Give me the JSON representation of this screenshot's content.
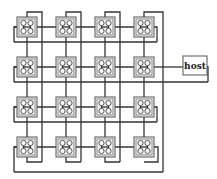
{
  "diagram": {
    "grid": {
      "rows": 4,
      "cols": 4
    },
    "node_x": [
      17,
      56,
      95,
      134
    ],
    "node_y": [
      17,
      57,
      97,
      137
    ],
    "node_size": 20,
    "node_glyph": "2x2-processor-cluster",
    "host": {
      "label": "host",
      "x": 183,
      "y": 56,
      "w": 24,
      "h": 19,
      "connected_row": 1
    },
    "colors": {
      "wire": "#333333",
      "node_fill": "#f2f2f2",
      "node_stroke": "#555555"
    }
  }
}
